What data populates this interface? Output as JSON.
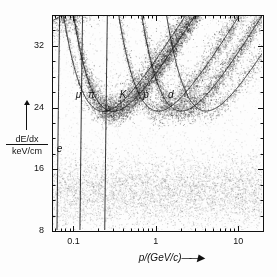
{
  "figure": {
    "kind": "dE/dx versus momentum particle identification scatter plot"
  },
  "chart_data": {
    "type": "scatter",
    "title": "",
    "xlabel": "p/(GeV/c)",
    "ylabel_numerator": "dE/dx",
    "ylabel_denominator": "keV/cm",
    "xscale": "log",
    "yscale": "linear",
    "xlim": [
      0.055,
      20
    ],
    "ylim": [
      8,
      36
    ],
    "grid": false,
    "legend": "inline-curve-labels",
    "xticks_major": [
      0.1,
      1,
      10
    ],
    "xticklabels": [
      "0.1",
      "1",
      "10"
    ],
    "xticks_minor": [
      0.06,
      0.07,
      0.08,
      0.09,
      0.2,
      0.3,
      0.4,
      0.5,
      0.6,
      0.7,
      0.8,
      0.9,
      2,
      3,
      4,
      5,
      6,
      7,
      8,
      9,
      20
    ],
    "yticks_major": [
      8,
      16,
      24,
      32
    ],
    "yticklabels": [
      "8",
      "16",
      "24",
      "32"
    ],
    "yticks_minor": [
      10,
      12,
      14,
      18,
      20,
      22,
      26,
      28,
      30,
      34
    ],
    "curve_labels": [
      {
        "name": "muon",
        "text": "μ",
        "x": 0.115,
        "y": 25.6
      },
      {
        "name": "pion",
        "text": "π",
        "x": 0.165,
        "y": 25.6
      },
      {
        "name": "kaon",
        "text": "K",
        "x": 0.4,
        "y": 25.6
      },
      {
        "name": "proton",
        "text": "p",
        "x": 0.76,
        "y": 25.6
      },
      {
        "name": "deuteron",
        "text": "d",
        "x": 1.52,
        "y": 25.6
      },
      {
        "name": "electron",
        "text": "e",
        "x": 0.068,
        "y": 18.6
      }
    ],
    "series": [
      {
        "name": "electron",
        "mass_gev": 0.000511,
        "label": "e",
        "n_points": 9000,
        "band_sigma": 1.35
      },
      {
        "name": "muon",
        "mass_gev": 0.1057,
        "label": "μ",
        "n_points": 2600,
        "band_sigma": 0.85
      },
      {
        "name": "pion",
        "mass_gev": 0.1396,
        "label": "π",
        "n_points": 9000,
        "band_sigma": 0.85
      },
      {
        "name": "kaon",
        "mass_gev": 0.4937,
        "label": "K",
        "n_points": 3400,
        "band_sigma": 0.85
      },
      {
        "name": "proton",
        "mass_gev": 0.9383,
        "label": "p",
        "n_points": 4200,
        "band_sigma": 0.85
      },
      {
        "name": "deuteron",
        "mass_gev": 1.8756,
        "label": "d",
        "n_points": 1500,
        "band_sigma": 0.85
      }
    ],
    "fit_curves": [
      "electron",
      "muon",
      "pion",
      "kaon",
      "proton",
      "deuteron"
    ]
  },
  "axes": {
    "x_title": "p/(GeV/c)",
    "x_arrow": "→",
    "y_arrow": "↑"
  }
}
